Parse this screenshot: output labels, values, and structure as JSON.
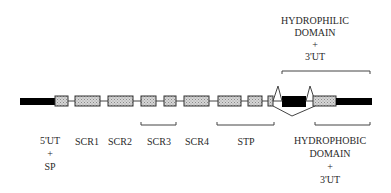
{
  "diagram": {
    "top_label": {
      "lines": [
        "HYDROPHILIC",
        "DOMAIN",
        "+",
        "3'UT"
      ]
    },
    "bottom_labels": [
      {
        "id": "5ut-sp",
        "lines": [
          "5'UT",
          "+",
          "SP"
        ]
      },
      {
        "id": "scr1",
        "lines": [
          "SCR1"
        ]
      },
      {
        "id": "scr2",
        "lines": [
          "SCR2"
        ]
      },
      {
        "id": "scr3",
        "lines": [
          "SCR3"
        ]
      },
      {
        "id": "scr4",
        "lines": [
          "SCR4"
        ]
      },
      {
        "id": "stp",
        "lines": [
          "STP"
        ]
      },
      {
        "id": "hydrophobic",
        "lines": [
          "HYDROPHOBIC",
          "DOMAIN",
          "+",
          "3'UT"
        ]
      }
    ],
    "colors": {
      "exon_fill": "#c8c8c8",
      "exon_stroke": "#333333",
      "utr": "#000000",
      "intron": "#444444"
    }
  }
}
